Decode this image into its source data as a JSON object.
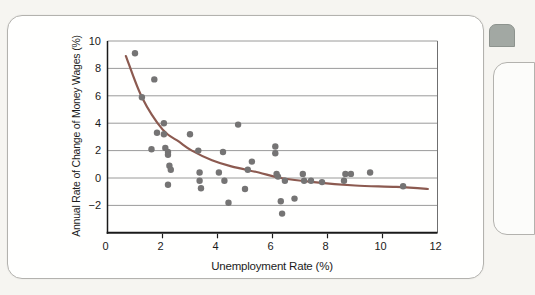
{
  "page": {
    "background_color": "#f6f5f1"
  },
  "card": {
    "background_color": "#fffffe",
    "border_color": "#b3b2ae"
  },
  "side_tab": {
    "color": "#a2a8a3"
  },
  "chart_data": {
    "type": "scatter",
    "title": "",
    "xlabel": "Unemployment Rate (%)",
    "ylabel": "Annual Rate of Change of Money Wages (%)",
    "xlim": [
      0,
      12
    ],
    "ylim": [
      -4,
      10
    ],
    "grid": "horizontal",
    "legend": "none",
    "xticks": [
      0,
      2,
      4,
      6,
      8,
      10,
      12
    ],
    "xtick_labels": [
      "0",
      "2",
      "4",
      "6",
      "8",
      "10",
      "12"
    ],
    "xtick_marks": [
      2,
      4,
      6,
      8,
      10
    ],
    "yticks": [
      10,
      8,
      6,
      4,
      2,
      0,
      -2
    ],
    "ytick_labels": [
      "10",
      "8",
      "6",
      "4",
      "2",
      "0",
      "−2"
    ],
    "point_color": "#757474",
    "points": [
      [
        1.0,
        9.1
      ],
      [
        1.7,
        7.2
      ],
      [
        1.25,
        5.9
      ],
      [
        2.05,
        4.0
      ],
      [
        1.8,
        3.3
      ],
      [
        2.05,
        3.2
      ],
      [
        3.0,
        3.2
      ],
      [
        1.6,
        2.1
      ],
      [
        2.1,
        2.2
      ],
      [
        2.2,
        1.9
      ],
      [
        2.2,
        1.7
      ],
      [
        2.25,
        0.9
      ],
      [
        2.3,
        0.6
      ],
      [
        2.2,
        -0.5
      ],
      [
        3.3,
        2.0
      ],
      [
        3.35,
        0.4
      ],
      [
        3.35,
        -0.2
      ],
      [
        3.4,
        -0.75
      ],
      [
        4.05,
        0.4
      ],
      [
        4.25,
        -0.2
      ],
      [
        4.4,
        -1.8
      ],
      [
        4.2,
        1.9
      ],
      [
        4.75,
        3.9
      ],
      [
        5.25,
        1.2
      ],
      [
        5.1,
        0.6
      ],
      [
        5.0,
        -0.8
      ],
      [
        6.1,
        2.3
      ],
      [
        6.1,
        1.8
      ],
      [
        6.15,
        0.3
      ],
      [
        6.2,
        0.1
      ],
      [
        6.45,
        -0.2
      ],
      [
        6.3,
        -1.7
      ],
      [
        6.8,
        -1.5
      ],
      [
        6.35,
        -2.6
      ],
      [
        7.1,
        0.3
      ],
      [
        7.15,
        -0.2
      ],
      [
        7.4,
        -0.2
      ],
      [
        7.8,
        -0.3
      ],
      [
        8.65,
        0.3
      ],
      [
        8.85,
        0.3
      ],
      [
        8.6,
        -0.2
      ],
      [
        9.55,
        0.4
      ],
      [
        10.75,
        -0.6
      ]
    ],
    "curve": {
      "name": "fitted-phillips-curve",
      "color": "#8c5a50",
      "control_points": [
        [
          0.67,
          8.9
        ],
        [
          1.25,
          5.9
        ],
        [
          2.0,
          3.55
        ],
        [
          2.6,
          2.65
        ],
        [
          3.07,
          2.0
        ],
        [
          3.8,
          1.3
        ],
        [
          4.5,
          0.85
        ],
        [
          5.5,
          0.4
        ],
        [
          6.3,
          0.0
        ],
        [
          7.5,
          -0.3
        ],
        [
          9.0,
          -0.55
        ],
        [
          10.5,
          -0.65
        ],
        [
          11.65,
          -0.8
        ]
      ]
    }
  }
}
